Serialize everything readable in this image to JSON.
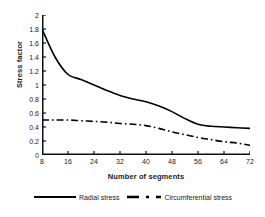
{
  "chart_data": {
    "type": "line",
    "title": "",
    "xlabel": "Number of segments",
    "ylabel": "Stress factor",
    "xlim": [
      8,
      72
    ],
    "ylim": [
      0,
      2
    ],
    "grid": false,
    "legend_position": "bottom",
    "xticks": [
      "8",
      "16",
      "24",
      "32",
      "40",
      "48",
      "56",
      "64",
      "72"
    ],
    "yticks": [
      "0",
      "0.2",
      "0.4",
      "0.6",
      "0.8",
      "1",
      "1.2",
      "1.4",
      "1.6",
      "1.8",
      "2"
    ],
    "x": [
      8,
      12,
      16,
      20,
      24,
      28,
      32,
      36,
      40,
      44,
      48,
      52,
      56,
      60,
      64,
      68,
      72
    ],
    "series": [
      {
        "name": "Radial stress",
        "style": "solid",
        "color": "#000000",
        "values": [
          1.8,
          1.4,
          1.15,
          1.08,
          1.0,
          0.92,
          0.85,
          0.8,
          0.76,
          0.7,
          0.62,
          0.52,
          0.44,
          0.41,
          0.4,
          0.39,
          0.38
        ]
      },
      {
        "name": "Circumferential stress",
        "style": "dash-dot",
        "color": "#000000",
        "values": [
          0.5,
          0.5,
          0.5,
          0.49,
          0.48,
          0.47,
          0.45,
          0.44,
          0.42,
          0.38,
          0.33,
          0.29,
          0.25,
          0.22,
          0.19,
          0.17,
          0.14
        ]
      }
    ]
  },
  "legend": {
    "entries": [
      {
        "label": "Radial stress",
        "style": "solid"
      },
      {
        "label": "Circumferential stress",
        "style": "dash-dot"
      }
    ]
  }
}
